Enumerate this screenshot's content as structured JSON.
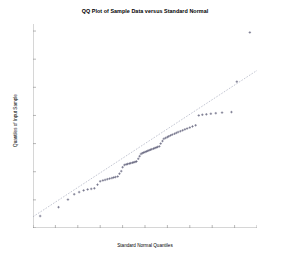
{
  "chart_data": {
    "type": "scatter",
    "title": "QQ Plot of Sample Data versus Standard Normal",
    "xlabel": "Standard Normal Quantiles",
    "ylabel": "Quantiles of Input Sample",
    "xlim": [
      -2.5,
      2.5
    ],
    "ylim": [
      -0.6,
      0.85
    ],
    "xticks": [
      -2.5,
      -2,
      -1.5,
      -1,
      -0.5,
      0,
      0.5,
      1,
      1.5,
      2,
      2.5
    ],
    "xticklabels": [
      "-2.5",
      "-2",
      "-1.5",
      "-1",
      "-0.5",
      "0",
      "0.5",
      "1",
      "1.5",
      "2",
      "2.5"
    ],
    "yticks": [
      -0.6,
      -0.4,
      -0.2,
      0,
      0.2,
      0.4,
      0.6,
      0.8
    ],
    "yticklabels": [
      "-0.6",
      "-0.4",
      "-0.2",
      "0",
      "0.2",
      "0.4",
      "0.6",
      "0.8"
    ],
    "grid": false,
    "legend": null,
    "marker": "plus",
    "marker_color": "#4a4a66",
    "reference_line": {
      "style": "dashed",
      "color": "#9aa0b4",
      "x": [
        -2.5,
        2.5
      ],
      "y": [
        -0.52,
        0.52
      ]
    },
    "series": [
      {
        "name": "Sample Data",
        "points": [
          [
            -2.34,
            -0.515
          ],
          [
            -1.93,
            -0.452
          ],
          [
            -1.72,
            -0.398
          ],
          [
            -1.58,
            -0.36
          ],
          [
            -1.47,
            -0.345
          ],
          [
            -1.37,
            -0.333
          ],
          [
            -1.28,
            -0.326
          ],
          [
            -1.2,
            -0.322
          ],
          [
            -1.13,
            -0.318
          ],
          [
            -1.06,
            -0.292
          ],
          [
            -1.0,
            -0.268
          ],
          [
            -0.94,
            -0.262
          ],
          [
            -0.89,
            -0.258
          ],
          [
            -0.84,
            -0.253
          ],
          [
            -0.79,
            -0.249
          ],
          [
            -0.74,
            -0.245
          ],
          [
            -0.7,
            -0.241
          ],
          [
            -0.66,
            -0.238
          ],
          [
            -0.61,
            -0.234
          ],
          [
            -0.57,
            -0.214
          ],
          [
            -0.53,
            -0.196
          ],
          [
            -0.5,
            -0.168
          ],
          [
            -0.46,
            -0.152
          ],
          [
            -0.42,
            -0.148
          ],
          [
            -0.39,
            -0.145
          ],
          [
            -0.35,
            -0.142
          ],
          [
            -0.32,
            -0.139
          ],
          [
            -0.28,
            -0.136
          ],
          [
            -0.25,
            -0.133
          ],
          [
            -0.22,
            -0.13
          ],
          [
            -0.19,
            -0.127
          ],
          [
            -0.15,
            -0.108
          ],
          [
            -0.12,
            -0.09
          ],
          [
            -0.09,
            -0.074
          ],
          [
            -0.06,
            -0.068
          ],
          [
            -0.03,
            -0.064
          ],
          [
            0.0,
            -0.06
          ],
          [
            0.03,
            -0.056
          ],
          [
            0.06,
            -0.052
          ],
          [
            0.09,
            -0.048
          ],
          [
            0.12,
            -0.044
          ],
          [
            0.15,
            -0.04
          ],
          [
            0.19,
            -0.036
          ],
          [
            0.22,
            -0.032
          ],
          [
            0.25,
            -0.028
          ],
          [
            0.28,
            -0.024
          ],
          [
            0.32,
            -0.02
          ],
          [
            0.35,
            0.0
          ],
          [
            0.39,
            0.018
          ],
          [
            0.42,
            0.034
          ],
          [
            0.46,
            0.04
          ],
          [
            0.5,
            0.046
          ],
          [
            0.53,
            0.052
          ],
          [
            0.57,
            0.058
          ],
          [
            0.61,
            0.064
          ],
          [
            0.66,
            0.07
          ],
          [
            0.7,
            0.076
          ],
          [
            0.74,
            0.082
          ],
          [
            0.79,
            0.088
          ],
          [
            0.84,
            0.094
          ],
          [
            0.89,
            0.101
          ],
          [
            0.94,
            0.107
          ],
          [
            1.0,
            0.114
          ],
          [
            1.06,
            0.122
          ],
          [
            1.13,
            0.13
          ],
          [
            1.2,
            0.2
          ],
          [
            1.28,
            0.205
          ],
          [
            1.37,
            0.208
          ],
          [
            1.47,
            0.212
          ],
          [
            1.58,
            0.216
          ],
          [
            1.72,
            0.22
          ],
          [
            1.93,
            0.224
          ],
          [
            2.05,
            0.44
          ],
          [
            2.34,
            0.79
          ]
        ]
      }
    ]
  }
}
